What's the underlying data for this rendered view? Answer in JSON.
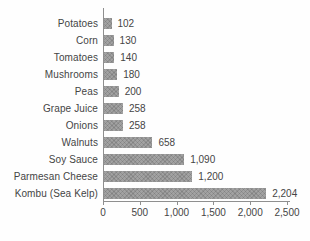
{
  "chart_data": {
    "type": "bar",
    "orientation": "horizontal",
    "title": "",
    "xlabel": "",
    "ylabel": "",
    "categories": [
      "Potatoes",
      "Corn",
      "Tomatoes",
      "Mushrooms",
      "Peas",
      "Grape Juice",
      "Onions",
      "Walnuts",
      "Soy Sauce",
      "Parmesan Cheese",
      "Kombu (Sea Kelp)"
    ],
    "values": [
      102,
      130,
      140,
      180,
      200,
      258,
      258,
      658,
      1090,
      1200,
      2204
    ],
    "value_labels": [
      "102",
      "130",
      "140",
      "180",
      "200",
      "258",
      "258",
      "658",
      "1,090",
      "1,200",
      "2,204"
    ],
    "xlim": [
      0,
      2500
    ],
    "x_ticks": [
      0,
      500,
      1000,
      1500,
      2000,
      2500
    ],
    "x_tick_labels": [
      "0",
      "500",
      "1,000",
      "1,500",
      "2,000",
      "2,500"
    ],
    "grid": false,
    "legend": false,
    "colors": {
      "bar": "#a2a2a2",
      "axis": "#8f8f8f",
      "text": "#454545",
      "background": "#fefefe"
    }
  }
}
